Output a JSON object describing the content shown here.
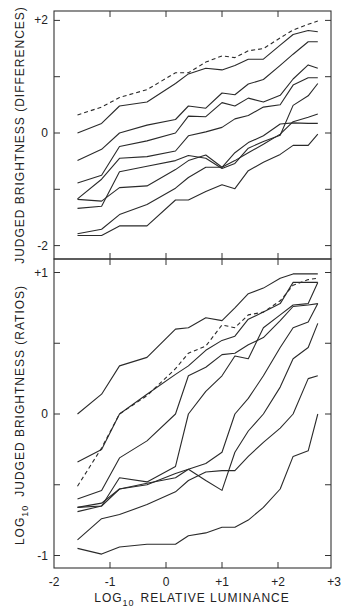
{
  "chart_data": [
    {
      "type": "line",
      "title": "",
      "xlabel": "LOG10 RELATIVE LUMINANCE",
      "ylabel": "JUDGED BRIGHTNESS (DIFFERENCES)",
      "xlim": [
        -2,
        3
      ],
      "ylim": [
        -2.2,
        2.2
      ],
      "yticks": [
        {
          "v": 2,
          "label": "+2"
        },
        {
          "v": 0,
          "label": "0"
        },
        {
          "v": -2,
          "label": "-2"
        }
      ],
      "yminor": [
        1,
        -1
      ],
      "x": [
        -1.58,
        -1.15,
        -0.83,
        -0.34,
        0.17,
        0.4,
        0.71,
        1.0,
        1.23,
        1.47,
        1.74,
        2.04,
        2.27,
        2.54,
        2.71
      ],
      "series": [
        {
          "name": "dashed",
          "style": "dashed",
          "values": [
            0.32,
            0.46,
            0.63,
            0.77,
            1.07,
            1.07,
            1.26,
            1.37,
            1.34,
            1.46,
            1.5,
            1.69,
            1.83,
            1.93,
            1.99
          ]
        },
        {
          "name": "A",
          "style": "solid",
          "values": [
            0.0,
            0.17,
            0.48,
            0.55,
            0.88,
            1.05,
            1.15,
            1.12,
            1.2,
            1.31,
            1.31,
            1.56,
            1.75,
            1.82,
            1.8
          ]
        },
        {
          "name": "B",
          "style": "solid",
          "values": [
            -0.49,
            -0.29,
            0.0,
            0.14,
            0.24,
            0.48,
            0.44,
            0.71,
            0.68,
            0.87,
            0.95,
            1.2,
            1.4,
            1.62,
            1.62
          ]
        },
        {
          "name": "C",
          "style": "solid",
          "values": [
            -0.89,
            -0.75,
            -0.24,
            -0.14,
            0.0,
            0.3,
            0.29,
            0.54,
            0.48,
            0.62,
            0.55,
            0.67,
            0.96,
            1.21,
            1.15
          ]
        },
        {
          "name": "D",
          "style": "solid",
          "values": [
            -1.17,
            -0.82,
            -0.45,
            -0.42,
            -0.32,
            -0.05,
            0.02,
            0.1,
            0.25,
            0.31,
            0.46,
            0.5,
            0.85,
            0.98,
            0.98
          ]
        },
        {
          "name": "E",
          "style": "solid",
          "values": [
            -1.34,
            -1.3,
            -0.69,
            -0.59,
            -0.49,
            -0.4,
            -0.45,
            -0.63,
            -0.54,
            -0.27,
            -0.15,
            -0.04,
            0.49,
            0.66,
            0.88
          ]
        },
        {
          "name": "F",
          "style": "solid",
          "values": [
            -1.18,
            -1.21,
            -0.97,
            -0.94,
            -0.65,
            -0.49,
            -0.39,
            -0.61,
            -0.49,
            -0.35,
            -0.2,
            -0.02,
            0.2,
            0.28,
            0.34
          ]
        },
        {
          "name": "G",
          "style": "solid",
          "values": [
            -1.79,
            -1.71,
            -1.45,
            -1.27,
            -0.98,
            -0.79,
            -0.61,
            -0.61,
            -0.35,
            -0.17,
            -0.05,
            0.16,
            0.18,
            0.17,
            0.17
          ]
        },
        {
          "name": "H",
          "style": "solid",
          "values": [
            -1.82,
            -1.82,
            -1.65,
            -1.65,
            -1.19,
            -1.19,
            -1.04,
            -0.92,
            -0.99,
            -0.67,
            -0.52,
            -0.38,
            -0.22,
            -0.22,
            -0.02
          ]
        }
      ]
    },
    {
      "type": "line",
      "title": "",
      "xlabel": "LOG10 RELATIVE LUMINANCE",
      "ylabel": "LOG10 JUDGED BRIGHTNESS (RATIOS)",
      "xlim": [
        -2,
        3
      ],
      "ylim": [
        -1.09,
        1.1
      ],
      "yticks": [
        {
          "v": 1,
          "label": "+1"
        },
        {
          "v": 0,
          "label": "0"
        },
        {
          "v": -1,
          "label": "-1"
        }
      ],
      "yminor": [
        0.5,
        -0.5
      ],
      "xticks": [
        {
          "v": -2,
          "label": "-2"
        },
        {
          "v": -1,
          "label": "-1"
        },
        {
          "v": 0,
          "label": "0"
        },
        {
          "v": 1,
          "label": "+1"
        },
        {
          "v": 2,
          "label": "+2"
        },
        {
          "v": 3,
          "label": "+3"
        }
      ],
      "x": [
        -1.58,
        -1.15,
        -0.83,
        -0.34,
        0.17,
        0.4,
        0.71,
        1.0,
        1.23,
        1.47,
        1.74,
        2.04,
        2.27,
        2.54,
        2.71
      ],
      "series": [
        {
          "name": "1",
          "style": "solid",
          "values": [
            0.0,
            0.14,
            0.34,
            0.4,
            0.6,
            0.61,
            0.68,
            0.66,
            0.75,
            0.85,
            0.89,
            0.96,
            0.99,
            0.99,
            0.99
          ]
        },
        {
          "name": "dashed",
          "style": "dashed",
          "values": [
            -0.51,
            -0.24,
            0.0,
            0.13,
            0.32,
            0.43,
            0.48,
            0.63,
            0.61,
            0.7,
            0.72,
            0.8,
            0.91,
            0.95,
            0.96
          ]
        },
        {
          "name": "3",
          "style": "solid",
          "values": [
            -0.34,
            -0.25,
            0.0,
            0.14,
            0.28,
            0.34,
            0.45,
            0.52,
            0.55,
            0.67,
            0.72,
            0.78,
            0.93,
            0.93,
            0.93
          ]
        },
        {
          "name": "4",
          "style": "solid",
          "values": [
            -0.6,
            -0.54,
            -0.31,
            -0.19,
            0.0,
            0.27,
            0.33,
            0.42,
            0.43,
            0.49,
            0.54,
            0.66,
            0.76,
            0.77,
            0.78
          ]
        },
        {
          "name": "5",
          "style": "solid",
          "values": [
            -0.66,
            -0.65,
            -0.45,
            -0.48,
            -0.37,
            0.0,
            0.16,
            0.27,
            0.41,
            0.39,
            0.61,
            0.7,
            0.77,
            0.78,
            0.93
          ]
        },
        {
          "name": "6",
          "style": "solid",
          "values": [
            -0.66,
            -0.63,
            -0.53,
            -0.5,
            -0.42,
            -0.39,
            -0.35,
            -0.27,
            0.0,
            0.11,
            0.27,
            0.47,
            0.61,
            0.65,
            0.78
          ]
        },
        {
          "name": "7",
          "style": "solid",
          "values": [
            -0.69,
            -0.65,
            -0.53,
            -0.49,
            -0.45,
            -0.39,
            -0.47,
            -0.54,
            -0.27,
            -0.12,
            0.0,
            0.19,
            0.39,
            0.47,
            0.64
          ]
        },
        {
          "name": "8",
          "style": "solid",
          "values": [
            -0.89,
            -0.74,
            -0.71,
            -0.64,
            -0.55,
            -0.47,
            -0.41,
            -0.4,
            -0.4,
            -0.3,
            -0.2,
            -0.1,
            0.0,
            0.25,
            0.27
          ]
        },
        {
          "name": "9",
          "style": "solid",
          "values": [
            -0.95,
            -0.99,
            -0.94,
            -0.92,
            -0.92,
            -0.86,
            -0.84,
            -0.8,
            -0.8,
            -0.75,
            -0.66,
            -0.53,
            -0.3,
            -0.26,
            0.0
          ]
        }
      ]
    }
  ],
  "labels": {
    "top_ylabel": "JUDGED BRIGHTNESS (DIFFERENCES)",
    "bottom_ylabel_prefix": "LOG",
    "bottom_ylabel_sub": "10",
    "bottom_ylabel_rest": "JUDGED BRIGHTNESS (RATIOS)",
    "xlabel_prefix": "LOG",
    "xlabel_sub": "10",
    "xlabel_rest": "RELATIVE LUMINANCE"
  }
}
